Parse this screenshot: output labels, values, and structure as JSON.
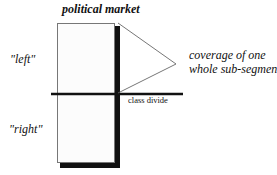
{
  "diagram": {
    "title": "political market",
    "segments": {
      "top_label": "\"left\"",
      "bottom_label": "\"right\""
    },
    "divider": {
      "label": "class divide"
    },
    "callout": {
      "line1": "coverage of one",
      "line2": "whole sub-segment"
    },
    "colors": {
      "box_fill": "#fcfcfc",
      "shadow": "#111111",
      "lines": "#555555"
    }
  }
}
